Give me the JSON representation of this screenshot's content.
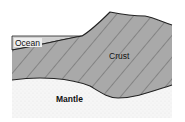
{
  "diagram": {
    "labels": {
      "ocean": "Ocean",
      "crust": "Crust",
      "mantle": "Mantle"
    },
    "colors": {
      "ocean": "#cfcfcf",
      "crust": "#a9a9a9",
      "mantle": "#f4f4f4",
      "outline": "#222222",
      "hatch": "#555555"
    }
  }
}
